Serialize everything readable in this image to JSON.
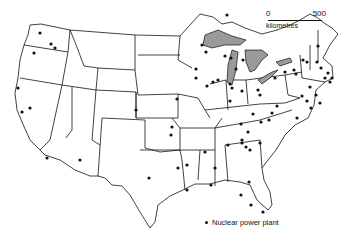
{
  "scale_bar": {
    "start_label": "0",
    "end_label": "500",
    "unit_label": "kilometres"
  },
  "legend": {
    "symbol": "dot",
    "label": "Nuclear power plant"
  },
  "colors": {
    "lines": "#111111",
    "lakes": "#9a9a9a",
    "background": "#ffffff"
  },
  "plants": [
    [
      40,
      33
    ],
    [
      51,
      44
    ],
    [
      55,
      48
    ],
    [
      34,
      53
    ],
    [
      18,
      88
    ],
    [
      30,
      108
    ],
    [
      22,
      112
    ],
    [
      47,
      158
    ],
    [
      80,
      160
    ],
    [
      136,
      110
    ],
    [
      172,
      127
    ],
    [
      227,
      15
    ],
    [
      177,
      99
    ],
    [
      171,
      135
    ],
    [
      149,
      178
    ],
    [
      178,
      168
    ],
    [
      205,
      152
    ],
    [
      215,
      168
    ],
    [
      211,
      185
    ],
    [
      187,
      165
    ],
    [
      228,
      145
    ],
    [
      253,
      114
    ],
    [
      242,
      140
    ],
    [
      230,
      101
    ],
    [
      242,
      143
    ],
    [
      246,
      147
    ],
    [
      250,
      150
    ],
    [
      260,
      143
    ],
    [
      248,
      132
    ],
    [
      277,
      106
    ],
    [
      297,
      118
    ],
    [
      272,
      113
    ],
    [
      261,
      122
    ],
    [
      269,
      120
    ],
    [
      249,
      182
    ],
    [
      241,
      195
    ],
    [
      251,
      205
    ],
    [
      263,
      212
    ],
    [
      187,
      190
    ],
    [
      241,
      124
    ],
    [
      202,
      45
    ],
    [
      206,
      52
    ],
    [
      225,
      56
    ],
    [
      231,
      58
    ],
    [
      243,
      60
    ],
    [
      236,
      69
    ],
    [
      196,
      69
    ],
    [
      196,
      78
    ],
    [
      207,
      86
    ],
    [
      213,
      82
    ],
    [
      218,
      80
    ],
    [
      230,
      84
    ],
    [
      232,
      88
    ],
    [
      242,
      91
    ],
    [
      258,
      90
    ],
    [
      260,
      95
    ],
    [
      275,
      78
    ],
    [
      285,
      72
    ],
    [
      294,
      70
    ],
    [
      296,
      74
    ],
    [
      303,
      60
    ],
    [
      307,
      62
    ],
    [
      317,
      62
    ],
    [
      321,
      68
    ],
    [
      328,
      73
    ],
    [
      330,
      82
    ],
    [
      310,
      87
    ],
    [
      302,
      96
    ],
    [
      316,
      95
    ],
    [
      307,
      101
    ],
    [
      320,
      103
    ],
    [
      311,
      108
    ],
    [
      325,
      78
    ],
    [
      332,
      78
    ],
    [
      318,
      46
    ]
  ]
}
